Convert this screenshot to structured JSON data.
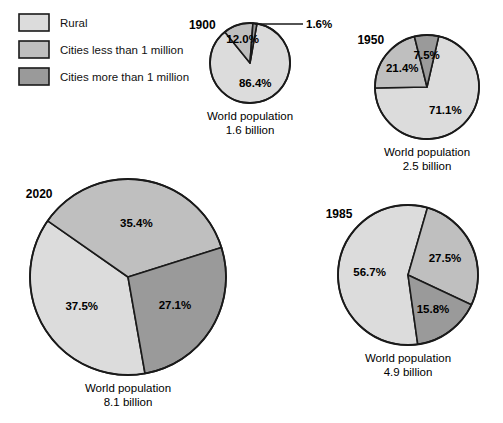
{
  "legend": {
    "items": [
      {
        "label": "Rural",
        "color": "#dcdcdc",
        "key": "rural"
      },
      {
        "label": "Cities less than 1 million",
        "color": "#bfbfbf",
        "key": "cities_lt_1m"
      },
      {
        "label": "Cities more than 1 million",
        "color": "#9a9a9a",
        "key": "cities_gt_1m"
      }
    ]
  },
  "caption_prefix": "World population",
  "chart_data": {
    "type": "pie",
    "title": "",
    "subtitle": "",
    "legend_position": "top-left",
    "grid": false,
    "categories": [
      "Rural",
      "Cities less than 1 million",
      "Cities more than 1 million"
    ],
    "colors": [
      "#dcdcdc",
      "#bfbfbf",
      "#9a9a9a"
    ],
    "unit": "%",
    "charts": [
      {
        "year": "1900",
        "population_caption": "World population",
        "population_value": "1.6 billion",
        "values": [
          86.4,
          12.0,
          1.6
        ],
        "labels": [
          "86.4%",
          "12.0%",
          "1.6%"
        ],
        "center": [
          250,
          63
        ],
        "radius": 40,
        "start_angle": 10,
        "label_radii": [
          0.52,
          0.62,
          1.0
        ],
        "leader_slice": 2
      },
      {
        "year": "1950",
        "population_caption": "World population",
        "population_value": "2.5 billion",
        "values": [
          71.1,
          21.4,
          7.5
        ],
        "labels": [
          "71.1%",
          "21.4%",
          "7.5%"
        ],
        "center": [
          427,
          87
        ],
        "radius": 52,
        "start_angle": 13,
        "label_radii": [
          0.56,
          0.6,
          0.62
        ],
        "leader_slice": -1
      },
      {
        "year": "2020",
        "population_caption": "World population",
        "population_value": "8.1 billion",
        "values": [
          37.5,
          35.4,
          27.1
        ],
        "labels": [
          "37.5%",
          "35.4%",
          "27.1%"
        ],
        "center": [
          128,
          277
        ],
        "radius": 98,
        "start_angle": 170,
        "label_radii": [
          0.56,
          0.56,
          0.56
        ],
        "leader_slice": -1
      },
      {
        "year": "1985",
        "population_caption": "World population",
        "population_value": "4.9 billion",
        "values": [
          56.7,
          27.5,
          15.8
        ],
        "labels": [
          "56.7%",
          "27.5%",
          "15.8%"
        ],
        "center": [
          408,
          275
        ],
        "radius": 70,
        "start_angle": 172,
        "label_radii": [
          0.55,
          0.58,
          0.6
        ],
        "leader_slice": -1
      }
    ]
  }
}
